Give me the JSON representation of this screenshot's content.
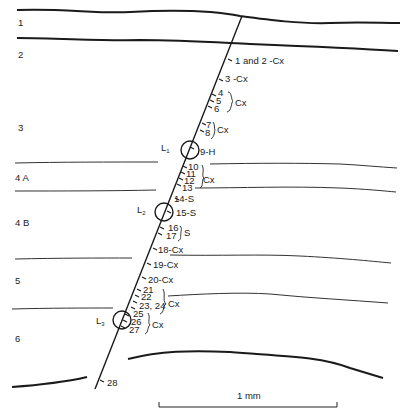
{
  "diagram": {
    "layers": [
      {
        "id": "1",
        "label": "1"
      },
      {
        "id": "2",
        "label": "2"
      },
      {
        "id": "3",
        "label": "3"
      },
      {
        "id": "4A",
        "label": "4 A"
      },
      {
        "id": "4B",
        "label": "4 B"
      },
      {
        "id": "5",
        "label": "5"
      },
      {
        "id": "6",
        "label": "6"
      }
    ],
    "lesions": [
      {
        "id": "L1",
        "label": "L",
        "sub": "1"
      },
      {
        "id": "L2",
        "label": "L",
        "sub": "2"
      },
      {
        "id": "L3",
        "label": "L",
        "sub": "3"
      }
    ],
    "recordings": {
      "r1_2": "1 and 2 -Cx",
      "r3": "3 -Cx",
      "r4": "4",
      "r5": "5",
      "r6": "6",
      "r4_6_class": "Cx",
      "r7": "7",
      "r8": "8",
      "r7_8_class": "Cx",
      "r9": "9-H",
      "r10": "10",
      "r11": "11",
      "r12": "12",
      "r13": "13",
      "r10_13_class": "Cx",
      "r14": "14-S",
      "r15": "15-S",
      "r16": "16",
      "r17": "17",
      "r16_17_class": "S",
      "r18": "18-Cx",
      "r19": "19-Cx",
      "r20": "20-Cx",
      "r21": "21",
      "r22": "22",
      "r23_24": "23, 24",
      "r21_24_class": "Cx",
      "r25": "25",
      "r26": "26",
      "r27": "27",
      "r25_27_class": "Cx",
      "r28": "28"
    },
    "scale_bar": {
      "label": "1 mm"
    }
  }
}
